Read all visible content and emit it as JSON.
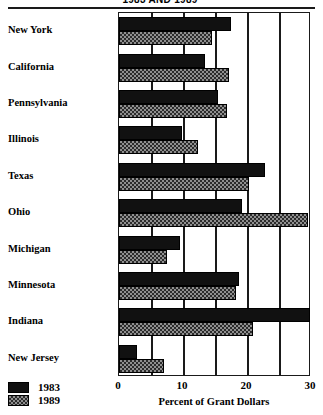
{
  "chart_data": {
    "type": "bar",
    "orientation": "horizontal",
    "title": "1983 AND 1989",
    "xlabel": "Percent of Grant Dollars",
    "ylabel": "",
    "xlim": [
      0,
      30
    ],
    "xticks": [
      0,
      10,
      20,
      30
    ],
    "xtick_labels": [
      "0",
      "10",
      "20",
      "30"
    ],
    "gridlines": [
      5,
      10,
      15,
      20,
      25
    ],
    "grid": true,
    "legend_position": "bottom-left",
    "categories": [
      "New York",
      "California",
      "Pennsylvania",
      "Illinois",
      "Texas",
      "Ohio",
      "Michigan",
      "Minnesota",
      "Indiana",
      "New Jersey"
    ],
    "series": [
      {
        "name": "1983",
        "color": "#111111",
        "pattern": "solid",
        "values": [
          17.5,
          13.5,
          15.5,
          9.8,
          22.8,
          19.2,
          9.5,
          18.8,
          29.8,
          2.8
        ]
      },
      {
        "name": "1989",
        "color": "#8f8f8f",
        "pattern": "checker-hatch",
        "values": [
          14.5,
          17.2,
          16.8,
          12.3,
          20.3,
          29.5,
          7.5,
          18.3,
          21.0,
          7.0
        ]
      }
    ]
  },
  "legend": {
    "entries": [
      {
        "label": "1983",
        "swatch": "solid"
      },
      {
        "label": "1989",
        "swatch": "hatch"
      }
    ]
  }
}
